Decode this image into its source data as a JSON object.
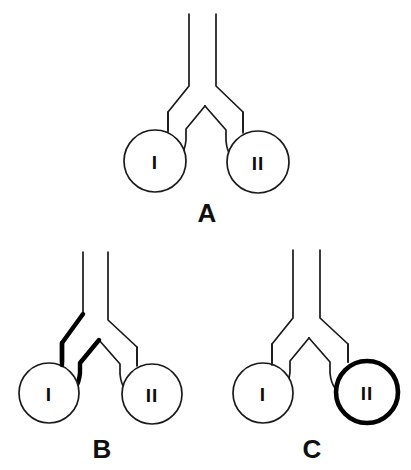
{
  "figure": {
    "background_color": "#ffffff",
    "line_color": "#1a1a1a",
    "bold_color": "#000000",
    "label_color": "#101010"
  },
  "panels": [
    {
      "id": "A",
      "label": "A",
      "label_x": 207,
      "label_y": 222,
      "highlight": "none",
      "chambers": [
        {
          "id": "I",
          "label": "I",
          "cx": 155,
          "cy": 161,
          "r": 31,
          "bold": false
        },
        {
          "id": "II",
          "label": "II",
          "cx": 258,
          "cy": 162,
          "r": 31,
          "bold": false
        }
      ],
      "stems": [
        {
          "id": "left-stem",
          "bold": false,
          "x_top": 189,
          "y_top": 14,
          "y_bend": 85
        },
        {
          "id": "right-stem",
          "bold": false,
          "x_top": 216,
          "y_top": 14,
          "y_bend": 85
        }
      ]
    },
    {
      "id": "B",
      "label": "B",
      "label_x": 102,
      "label_y": 458,
      "highlight": "left-branch",
      "chambers": [
        {
          "id": "I",
          "label": "I",
          "cx": 49,
          "cy": 393,
          "r": 30,
          "bold": false
        },
        {
          "id": "II",
          "label": "II",
          "cx": 152,
          "cy": 394,
          "r": 30,
          "bold": false
        }
      ],
      "stems": [
        {
          "id": "left-stem",
          "bold": false,
          "x_top": 83,
          "y_top": 252,
          "y_bend": 320
        },
        {
          "id": "right-stem",
          "bold": false,
          "x_top": 108,
          "y_top": 252,
          "y_bend": 320
        }
      ]
    },
    {
      "id": "C",
      "label": "C",
      "label_x": 312,
      "label_y": 458,
      "highlight": "chamber-II",
      "chambers": [
        {
          "id": "I",
          "label": "I",
          "cx": 263,
          "cy": 393,
          "r": 30,
          "bold": false
        },
        {
          "id": "II",
          "label": "II",
          "cx": 367,
          "cy": 392,
          "r": 31,
          "bold": true
        }
      ],
      "stems": [
        {
          "id": "left-stem",
          "bold": false,
          "x_top": 293,
          "y_top": 250,
          "y_bend": 318
        },
        {
          "id": "right-stem",
          "bold": false,
          "x_top": 320,
          "y_top": 250,
          "y_bend": 318
        }
      ]
    }
  ],
  "geometry": {
    "canvas_width": 411,
    "canvas_height": 470,
    "stroke_width_normal": 1.7,
    "stroke_width_bold": 4.4
  }
}
